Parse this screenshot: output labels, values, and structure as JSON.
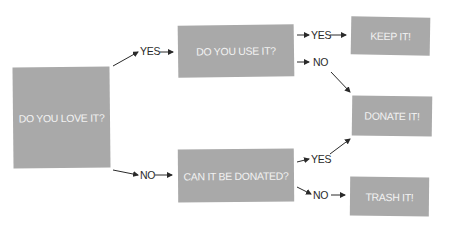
{
  "diagram": {
    "type": "decision-flowchart",
    "nodes": {
      "love": {
        "label": "DO YOU LOVE IT?"
      },
      "use": {
        "label": "DO YOU USE IT?"
      },
      "donatable": {
        "label": "CAN IT BE DONATED?"
      },
      "keep": {
        "label": "KEEP IT!"
      },
      "donate": {
        "label": "DONATE IT!"
      },
      "trash": {
        "label": "TRASH IT!"
      }
    },
    "edges": {
      "love_yes": {
        "label": "YES"
      },
      "love_no": {
        "label": "NO"
      },
      "use_yes": {
        "label": "YES"
      },
      "use_no": {
        "label": "NO"
      },
      "donatable_yes": {
        "label": "YES"
      },
      "donatable_no": {
        "label": "NO"
      }
    },
    "colors": {
      "box_fill": "#a9a9a9",
      "box_text": "#f2f2f2",
      "label_text": "#2a2a2a",
      "arrow": "#2a2a2a"
    }
  }
}
